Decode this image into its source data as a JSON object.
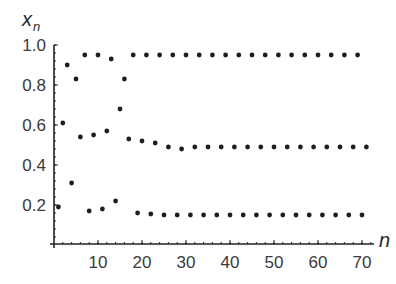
{
  "chart_data": {
    "type": "scatter",
    "title": "",
    "xlabel": "n",
    "ylabel": "x_n",
    "ylabel_main": "x",
    "ylabel_sub": "n",
    "xlim": [
      0,
      72
    ],
    "ylim": [
      0,
      1.0
    ],
    "x_ticks": [
      10,
      20,
      30,
      40,
      50,
      60,
      70
    ],
    "x_tick_labels": [
      "10",
      "20",
      "30",
      "40",
      "50",
      "60",
      "70"
    ],
    "y_ticks": [
      0.2,
      0.4,
      0.6,
      0.8,
      1.0
    ],
    "y_tick_labels": [
      "0.2",
      "0.4",
      "0.6",
      "0.8",
      "1.0"
    ],
    "grid": false,
    "legend": null,
    "series": [
      {
        "name": "x_n",
        "x": [
          1,
          2,
          3,
          4,
          5,
          6,
          7,
          8,
          9,
          10,
          11,
          12,
          13,
          14,
          15,
          16,
          17,
          18,
          19,
          20,
          21,
          22,
          23,
          24,
          25,
          26,
          27,
          28,
          29,
          30,
          31,
          32,
          33,
          34,
          35,
          36,
          37,
          38,
          39,
          40,
          41,
          42,
          43,
          44,
          45,
          46,
          47,
          48,
          49,
          50,
          51,
          52,
          53,
          54,
          55,
          56,
          57,
          58,
          59,
          60,
          61,
          62,
          63,
          64,
          65,
          66,
          67,
          68,
          69,
          70,
          71
        ],
        "values": [
          0.19,
          0.61,
          0.9,
          0.31,
          0.83,
          0.54,
          0.95,
          0.17,
          0.55,
          0.95,
          0.18,
          0.57,
          0.93,
          0.22,
          0.68,
          0.83,
          0.53,
          0.95,
          0.16,
          0.52,
          0.95,
          0.155,
          0.51,
          0.95,
          0.15,
          0.49,
          0.95,
          0.15,
          0.48,
          0.95,
          0.15,
          0.49,
          0.95,
          0.15,
          0.49,
          0.95,
          0.15,
          0.49,
          0.95,
          0.15,
          0.49,
          0.95,
          0.15,
          0.49,
          0.95,
          0.15,
          0.49,
          0.95,
          0.15,
          0.49,
          0.95,
          0.15,
          0.49,
          0.95,
          0.15,
          0.49,
          0.95,
          0.15,
          0.49,
          0.95,
          0.15,
          0.49,
          0.95,
          0.15,
          0.49,
          0.95,
          0.15,
          0.49,
          0.95,
          0.15,
          0.49
        ]
      }
    ]
  }
}
